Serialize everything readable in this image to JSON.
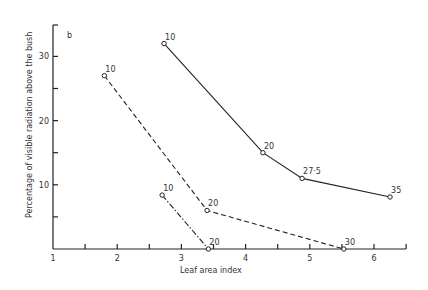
{
  "chart_data": {
    "type": "line",
    "title": "",
    "panel_label": "b",
    "xlabel": "Leaf area index",
    "ylabel": "Percentage of visible radiation above the bush",
    "xlim": [
      1,
      6.5
    ],
    "ylim": [
      0,
      35
    ],
    "x_ticks": [
      1,
      2,
      3,
      4,
      5,
      6
    ],
    "y_ticks": [
      10,
      20,
      30
    ],
    "grid": false,
    "legend": null,
    "series": [
      {
        "name": "solid",
        "style": "solid",
        "points": [
          {
            "x": 2.73,
            "y": 32,
            "label": "10"
          },
          {
            "x": 4.27,
            "y": 15,
            "label": "20"
          },
          {
            "x": 4.88,
            "y": 11,
            "label": "27·5"
          },
          {
            "x": 6.25,
            "y": 8.1,
            "label": "35"
          }
        ]
      },
      {
        "name": "dashed",
        "style": "dashed",
        "points": [
          {
            "x": 1.8,
            "y": 27,
            "label": "10"
          },
          {
            "x": 3.4,
            "y": 6,
            "label": "20"
          },
          {
            "x": 5.53,
            "y": 0,
            "label": "30"
          }
        ]
      },
      {
        "name": "dash-dot",
        "style": "dashdot",
        "points": [
          {
            "x": 2.7,
            "y": 8.4,
            "label": "10"
          },
          {
            "x": 3.42,
            "y": 0,
            "label": "20"
          }
        ]
      }
    ]
  }
}
